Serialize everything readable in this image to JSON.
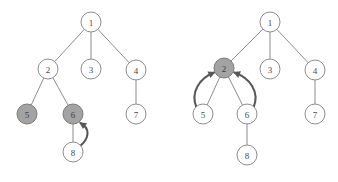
{
  "figure": {
    "title": "",
    "background_color": "#ffffff",
    "width": 338,
    "height": 182
  },
  "style": {
    "node_fill": "#ffffff",
    "node_shaded_fill": "#a3a3a3",
    "node_stroke": "#8d8d8d",
    "edge_color": "#8d8d8d",
    "arrow_color": "#58585a",
    "label_color": "#4a4a4a",
    "node_radius": 10
  },
  "panels": [
    {
      "id": "left-tree",
      "name": "before-move-tree",
      "nodes": [
        {
          "id": "n1",
          "label": "1",
          "cx": 91,
          "cy": 22,
          "shaded": false
        },
        {
          "id": "n2",
          "label": "2",
          "cx": 48,
          "cy": 69,
          "shaded": false
        },
        {
          "id": "n3",
          "label": "3",
          "cx": 91,
          "cy": 69,
          "shaded": false
        },
        {
          "id": "n4",
          "label": "4",
          "cx": 136,
          "cy": 70,
          "shaded": false
        },
        {
          "id": "n5",
          "label": "5",
          "cx": 27,
          "cy": 114,
          "shaded": true
        },
        {
          "id": "n6",
          "label": "6",
          "cx": 73,
          "cy": 114,
          "shaded": true
        },
        {
          "id": "n7",
          "label": "7",
          "cx": 136,
          "cy": 114,
          "shaded": false
        },
        {
          "id": "n8",
          "label": "8",
          "cx": 73,
          "cy": 152,
          "shaded": false
        }
      ],
      "edges": [
        {
          "from": "n1",
          "to": "n2"
        },
        {
          "from": "n1",
          "to": "n3"
        },
        {
          "from": "n1",
          "to": "n4"
        },
        {
          "from": "n2",
          "to": "n5"
        },
        {
          "from": "n2",
          "to": "n6"
        },
        {
          "from": "n4",
          "to": "n7"
        },
        {
          "from": "n6",
          "to": "n8"
        }
      ],
      "arrows": [
        {
          "id": "a1",
          "from": "n8",
          "to": "n6",
          "label": "",
          "path": "M 79.5 146.5 C 90 138 90 128 80.5 123.0"
        }
      ]
    },
    {
      "id": "right-tree",
      "name": "after-move-tree",
      "nodes": [
        {
          "id": "m1",
          "label": "1",
          "cx": 270,
          "cy": 22,
          "shaded": false
        },
        {
          "id": "m2",
          "label": "2",
          "cx": 224,
          "cy": 68,
          "shaded": true
        },
        {
          "id": "m3",
          "label": "3",
          "cx": 270,
          "cy": 69,
          "shaded": false
        },
        {
          "id": "m4",
          "label": "4",
          "cx": 315,
          "cy": 70,
          "shaded": false
        },
        {
          "id": "m5",
          "label": "5",
          "cx": 203,
          "cy": 114,
          "shaded": false
        },
        {
          "id": "m6",
          "label": "6",
          "cx": 247,
          "cy": 114,
          "shaded": false
        },
        {
          "id": "m7",
          "label": "7",
          "cx": 315,
          "cy": 114,
          "shaded": false
        },
        {
          "id": "m8",
          "label": "8",
          "cx": 247,
          "cy": 155,
          "shaded": false
        }
      ],
      "edges": [
        {
          "from": "m1",
          "to": "m2"
        },
        {
          "from": "m1",
          "to": "m3"
        },
        {
          "from": "m1",
          "to": "m4"
        },
        {
          "from": "m2",
          "to": "m5"
        },
        {
          "from": "m2",
          "to": "m6"
        },
        {
          "from": "m4",
          "to": "m7"
        },
        {
          "from": "m6",
          "to": "m8"
        }
      ],
      "arrows": [
        {
          "id": "b1",
          "from": "m5",
          "to": "m2",
          "label": "",
          "path": "M 196.5 107.5 C 190 92 200 78 214.0 72.5"
        },
        {
          "id": "b2",
          "from": "m6",
          "to": "m2",
          "label": "",
          "path": "M 253.5 107.5 C 260 92 250 78 234.5 72.5"
        }
      ]
    }
  ]
}
